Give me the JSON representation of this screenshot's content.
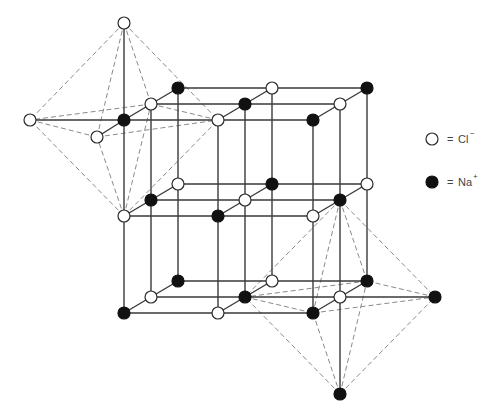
{
  "colors": {
    "background": "#ffffff",
    "bond": "#3a3a3a",
    "octahedron_edge": "#8a8a8a",
    "cl_fill": "#ffffff",
    "na_fill": "#111111",
    "node_stroke": "#2a2a2a"
  },
  "node_radius": 6,
  "legend": [
    {
      "id": "cl",
      "symbol": "open-circle",
      "equals": "=",
      "ion": "Cl",
      "charge": "−",
      "cx": 432,
      "cy": 139
    },
    {
      "id": "na",
      "symbol": "filled-circle",
      "equals": "=",
      "ion": "Na",
      "charge": "+",
      "cx": 432,
      "cy": 182
    }
  ],
  "lattice": {
    "size": [
      3,
      3,
      3
    ],
    "rule": "Na where i+j+k is even, Cl otherwise",
    "nodes": [
      {
        "id": "0-0-0",
        "x": 124,
        "y": 120,
        "ion": "Na"
      },
      {
        "id": "1-0-0",
        "x": 218,
        "y": 120,
        "ion": "Cl"
      },
      {
        "id": "2-0-0",
        "x": 313,
        "y": 120,
        "ion": "Na"
      },
      {
        "id": "0-1-0",
        "x": 124,
        "y": 216,
        "ion": "Cl"
      },
      {
        "id": "1-1-0",
        "x": 218,
        "y": 216,
        "ion": "Na"
      },
      {
        "id": "2-1-0",
        "x": 313,
        "y": 216,
        "ion": "Cl"
      },
      {
        "id": "0-2-0",
        "x": 124,
        "y": 313,
        "ion": "Na"
      },
      {
        "id": "1-2-0",
        "x": 218,
        "y": 313,
        "ion": "Cl"
      },
      {
        "id": "2-2-0",
        "x": 313,
        "y": 313,
        "ion": "Na"
      },
      {
        "id": "0-0-1",
        "x": 151,
        "y": 104,
        "ion": "Cl"
      },
      {
        "id": "1-0-1",
        "x": 245,
        "y": 104,
        "ion": "Na"
      },
      {
        "id": "2-0-1",
        "x": 340,
        "y": 104,
        "ion": "Cl"
      },
      {
        "id": "0-1-1",
        "x": 151,
        "y": 200,
        "ion": "Na"
      },
      {
        "id": "1-1-1",
        "x": 245,
        "y": 200,
        "ion": "Cl"
      },
      {
        "id": "2-1-1",
        "x": 340,
        "y": 200,
        "ion": "Na"
      },
      {
        "id": "0-2-1",
        "x": 151,
        "y": 297,
        "ion": "Cl"
      },
      {
        "id": "1-2-1",
        "x": 245,
        "y": 297,
        "ion": "Na"
      },
      {
        "id": "2-2-1",
        "x": 340,
        "y": 297,
        "ion": "Cl"
      },
      {
        "id": "0-0-2",
        "x": 178,
        "y": 88,
        "ion": "Na"
      },
      {
        "id": "1-0-2",
        "x": 272,
        "y": 88,
        "ion": "Cl"
      },
      {
        "id": "2-0-2",
        "x": 367,
        "y": 88,
        "ion": "Na"
      },
      {
        "id": "0-1-2",
        "x": 178,
        "y": 184,
        "ion": "Cl"
      },
      {
        "id": "1-1-2",
        "x": 272,
        "y": 184,
        "ion": "Na"
      },
      {
        "id": "2-1-2",
        "x": 367,
        "y": 184,
        "ion": "Cl"
      },
      {
        "id": "0-2-2",
        "x": 178,
        "y": 281,
        "ion": "Na"
      },
      {
        "id": "1-2-2",
        "x": 272,
        "y": 281,
        "ion": "Cl"
      },
      {
        "id": "2-2-2",
        "x": 367,
        "y": 281,
        "ion": "Na"
      }
    ]
  },
  "extra_nodes": [
    {
      "id": "oct1-top",
      "x": 124,
      "y": 23,
      "ion": "Cl"
    },
    {
      "id": "oct1-left",
      "x": 30,
      "y": 120,
      "ion": "Cl"
    },
    {
      "id": "oct1-front",
      "x": 97,
      "y": 137,
      "ion": "Cl"
    },
    {
      "id": "oct2-right",
      "x": 435,
      "y": 297,
      "ion": "Na"
    },
    {
      "id": "oct2-bottom",
      "x": 340,
      "y": 394,
      "ion": "Na"
    }
  ],
  "extra_bonds": [
    [
      "oct1-top",
      "0-0-0"
    ],
    [
      "oct1-left",
      "0-0-0"
    ],
    [
      "oct1-front",
      "0-0-0"
    ],
    [
      "2-2-1",
      "oct2-right"
    ],
    [
      "2-2-1",
      "oct2-bottom"
    ]
  ],
  "octahedra": [
    {
      "name": "octahedron-around-na",
      "center": "0-0-0",
      "vertices": {
        "top": "oct1-top",
        "bottom": "0-1-0",
        "left": "oct1-left",
        "right": "1-0-0",
        "front": "oct1-front",
        "back": "0-0-1"
      }
    },
    {
      "name": "octahedron-around-cl",
      "center": "2-2-1",
      "vertices": {
        "top": "2-1-1",
        "bottom": "oct2-bottom",
        "left": "1-2-1",
        "right": "oct2-right",
        "front": "2-2-0",
        "back": "2-2-2"
      }
    }
  ]
}
